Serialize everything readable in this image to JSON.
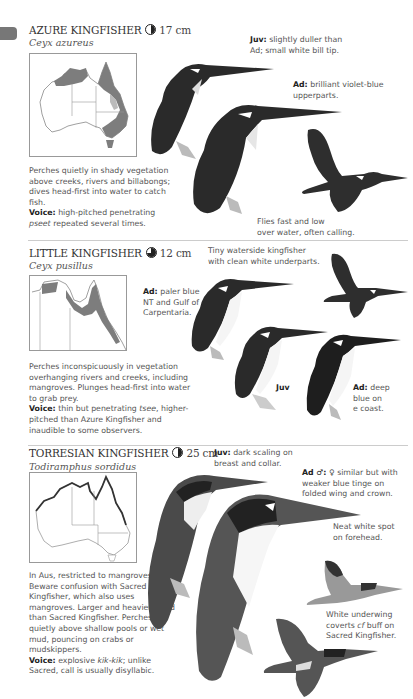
{
  "page": {
    "edge_tab_color": "#777777",
    "divider_color": "#cccccc"
  },
  "species": [
    {
      "common_name": "AZURE KINGFISHER",
      "size_icon": "half-circle-icon",
      "size": "17 cm",
      "scientific_name": "Ceyx azureus",
      "description": "Perches quietly in shady vegetation above creeks, rivers and billabongs; dives head-first into water to catch fish.",
      "voice_label": "Voice:",
      "voice_pre": "high-pitched penetrating ",
      "voice_italic": "pseet",
      "voice_post": " repeated several times.",
      "notes": [
        {
          "label": "Juv:",
          "text": "slightly duller than",
          "text2": "Ad; small white bill tip."
        },
        {
          "label": "Ad:",
          "text": "brilliant violet-blue",
          "text2": "upperparts."
        },
        {
          "label": "",
          "text": "Flies fast and low",
          "text2": "over water, often calling."
        }
      ]
    },
    {
      "common_name": "LITTLE KINGFISHER",
      "size_icon": "quarter-circle-icon",
      "size": "12 cm",
      "scientific_name": "Ceyx pusillus",
      "description": "Perches inconspicuously in vegetation overhanging rivers and creeks, including mangroves. Plunges head-first into water to grab prey.",
      "voice_label": "Voice:",
      "voice_pre": "thin but penetrating ",
      "voice_italic": "tsee",
      "voice_post": ", higher-pitched than Azure Kingfisher and inaudible to some observers.",
      "notes": [
        {
          "label": "",
          "text": "Tiny waterside kingfisher",
          "text2": "with clean white underparts."
        },
        {
          "label": "Ad:",
          "text": "paler blue",
          "text2": "NT and Gulf of",
          "text3": "Carpentaria."
        },
        {
          "label": "Juv",
          "text": ""
        },
        {
          "label": "Ad:",
          "text": "deep",
          "text2": "blue on",
          "text3": "e coast."
        }
      ]
    },
    {
      "common_name": "TORRESIAN KINGFISHER",
      "size_icon": "half-circle-icon",
      "size": "25 cm",
      "scientific_name": "Todiramphus sordidus",
      "description": "In Aus, restricted to mangroves. Beware confusion with Sacred Kingfisher, which also uses mangroves. Larger and heavier-billed than Sacred Kingfisher. Perches quietly above shallow pools or wet mud, pouncing on crabs or mudskippers.",
      "voice_label": "Voice:",
      "voice_pre": "explosive ",
      "voice_italic": "kik-kik",
      "voice_post": "; unlike Sacred, call is usually disyllabic.",
      "notes": [
        {
          "label": "Juv:",
          "text": "dark scaling on",
          "text2": "breast and collar."
        },
        {
          "label": "Ad ♂:",
          "text": "♀ similar but with",
          "text2": "weaker blue tinge on",
          "text3": "folded wing and crown."
        },
        {
          "label": "",
          "text": "Neat white spot",
          "text2": "on forehead."
        },
        {
          "label": "",
          "text": "White underwing",
          "text2": "coverts ",
          "text2_italic": "cf",
          "text2_post": " buff on",
          "text3": "Sacred Kingfisher."
        }
      ]
    }
  ]
}
